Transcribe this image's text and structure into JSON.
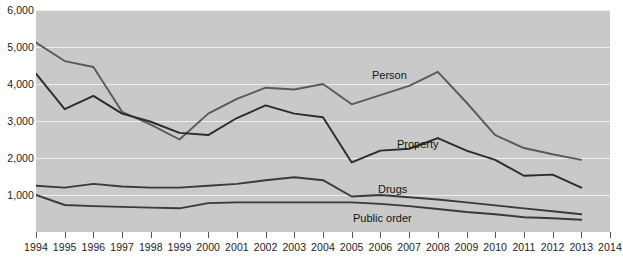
{
  "chart_data": {
    "type": "line",
    "title": "",
    "subtitle": "",
    "xlabel": "",
    "ylabel": "",
    "x": [
      1994,
      1995,
      1996,
      1997,
      1998,
      1999,
      2000,
      2001,
      2002,
      2003,
      2004,
      2005,
      2006,
      2007,
      2008,
      2009,
      2010,
      2011,
      2012,
      2013
    ],
    "categories": [
      "1994",
      "1995",
      "1996",
      "1997",
      "1998",
      "1999",
      "2000",
      "2001",
      "2002",
      "2003",
      "2004",
      "2005",
      "2006",
      "2007",
      "2008",
      "2009",
      "2010",
      "2011",
      "2012",
      "2013"
    ],
    "xlim": [
      1994,
      2014
    ],
    "ylim": [
      0,
      6000
    ],
    "yticks": [
      0,
      1000,
      2000,
      3000,
      4000,
      5000,
      6000
    ],
    "ytick_labels": [
      "0",
      "1,000",
      "2,000",
      "3,000",
      "4,000",
      "5,000",
      "6,000"
    ],
    "xtick_labels": [
      "1994",
      "1995",
      "1996",
      "1997",
      "1998",
      "1999",
      "2000",
      "2001",
      "2002",
      "2003",
      "2004",
      "2005",
      "2006",
      "2007",
      "2008",
      "2009",
      "2010",
      "2011",
      "2012",
      "2013",
      "2014"
    ],
    "grid": true,
    "grid_color": "#eef0ef",
    "plot_background": "#c9c9c9",
    "legend": "inline-labels",
    "series": [
      {
        "name": "Person",
        "color": "#5a5a5a",
        "values": [
          5120,
          4620,
          4460,
          3250,
          2900,
          2500,
          3200,
          3600,
          3900,
          3850,
          4000,
          3450,
          3700,
          3950,
          4330,
          3500,
          2620,
          2270,
          2100,
          1950
        ]
      },
      {
        "name": "Property",
        "color": "#2b2b2b",
        "values": [
          4280,
          3320,
          3680,
          3200,
          2980,
          2680,
          2620,
          3080,
          3420,
          3200,
          3100,
          1880,
          2200,
          2250,
          2540,
          2200,
          1950,
          1520,
          1550,
          1200
        ]
      },
      {
        "name": "Drugs",
        "color": "#3a3a3a",
        "values": [
          1250,
          1200,
          1300,
          1230,
          1200,
          1200,
          1250,
          1300,
          1400,
          1480,
          1400,
          960,
          1000,
          940,
          880,
          800,
          720,
          640,
          560,
          480
        ]
      },
      {
        "name": "Public order",
        "color": "#3a3a3a",
        "values": [
          1000,
          730,
          700,
          680,
          660,
          640,
          780,
          800,
          800,
          800,
          800,
          800,
          760,
          700,
          620,
          540,
          480,
          400,
          370,
          330
        ]
      }
    ],
    "annotations": [
      {
        "text": "Person",
        "series": "Person"
      },
      {
        "text": "Property",
        "series": "Property"
      },
      {
        "text": "Drugs",
        "series": "Drugs"
      },
      {
        "text": "Public order",
        "series": "Public order"
      }
    ]
  }
}
